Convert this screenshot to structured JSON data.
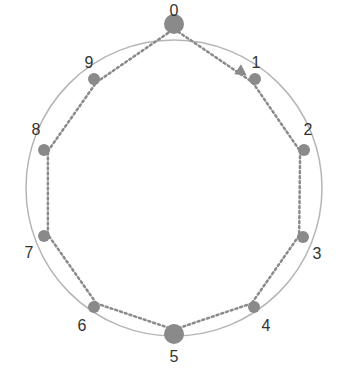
{
  "diagram": {
    "type": "ring",
    "colors": {
      "ring": "#b5b5b5",
      "node": "#8a8a8a",
      "path": "#8a8a8a",
      "label": "#333333"
    },
    "center": [
      174,
      188
    ],
    "radius": 148,
    "nodes": [
      {
        "label": "0",
        "x": 174,
        "y": 24,
        "r": 10,
        "lx": 174,
        "ly": 12
      },
      {
        "label": "1",
        "x": 255,
        "y": 79,
        "r": 6,
        "lx": 256,
        "ly": 64
      },
      {
        "label": "2",
        "x": 304,
        "y": 150,
        "r": 6,
        "lx": 308,
        "ly": 131
      },
      {
        "label": "3",
        "x": 303,
        "y": 237,
        "r": 6,
        "lx": 317,
        "ly": 255
      },
      {
        "label": "4",
        "x": 254,
        "y": 307,
        "r": 6,
        "lx": 266,
        "ly": 327
      },
      {
        "label": "5",
        "x": 174,
        "y": 334,
        "r": 10,
        "lx": 174,
        "ly": 358
      },
      {
        "label": "6",
        "x": 94,
        "y": 307,
        "r": 6,
        "lx": 82,
        "ly": 327
      },
      {
        "label": "7",
        "x": 44,
        "y": 236,
        "r": 6,
        "lx": 29,
        "ly": 254
      },
      {
        "label": "8",
        "x": 44,
        "y": 150,
        "r": 6,
        "lx": 36,
        "ly": 131
      },
      {
        "label": "9",
        "x": 94,
        "y": 79,
        "r": 6,
        "lx": 89,
        "ly": 64
      }
    ],
    "path_order": [
      "0",
      "1",
      "2",
      "3",
      "4",
      "5",
      "6",
      "7",
      "8",
      "9",
      "0"
    ]
  }
}
